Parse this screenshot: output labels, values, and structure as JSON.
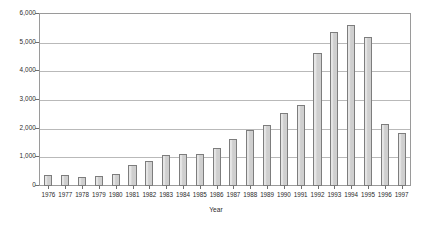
{
  "chart_data": {
    "type": "bar",
    "title": "",
    "subtitle": "",
    "xlabel": "Year",
    "ylabel": "",
    "categories": [
      "1976",
      "1977",
      "1978",
      "1979",
      "1980",
      "1981",
      "1982",
      "1983",
      "1984",
      "1985",
      "1986",
      "1987",
      "1988",
      "1989",
      "1990",
      "1991",
      "1992",
      "1993",
      "1994",
      "1995",
      "1996",
      "1997"
    ],
    "values": [
      400,
      370,
      330,
      360,
      420,
      730,
      870,
      1080,
      1120,
      1110,
      1330,
      1640,
      1960,
      2120,
      2540,
      2840,
      4640,
      5380,
      5620,
      5190,
      2150,
      1840
    ],
    "series": [
      {
        "name": "",
        "values": [
          400,
          370,
          330,
          360,
          420,
          730,
          870,
          1080,
          1120,
          1110,
          1330,
          1640,
          1960,
          2120,
          2540,
          2840,
          4640,
          5380,
          5620,
          5190,
          2150,
          1840
        ]
      }
    ],
    "ylim": [
      0,
      6000
    ],
    "yticks": [
      0,
      1000,
      2000,
      3000,
      4000,
      5000,
      6000
    ],
    "ytick_labels": [
      "0",
      "1,000",
      "2,000",
      "3,000",
      "4,000",
      "5,000",
      "6,000"
    ],
    "grid": true,
    "grid_axis": "y",
    "legend": false,
    "legend_position": "none",
    "bar_fill_color": "#d3d3d3",
    "bar_edge_color": "#7d7d7d",
    "grid_color": "#b9b9b9",
    "frame_color": "#9a9a9a",
    "text_color": "#2b2b2b",
    "background_color": "#ffffff"
  }
}
